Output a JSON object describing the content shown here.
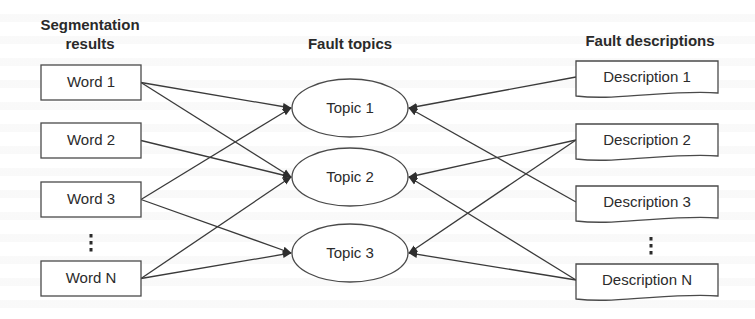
{
  "columns": {
    "left": {
      "title_line1": "Segmentation",
      "title_line2": "results"
    },
    "middle": {
      "title": "Fault topics"
    },
    "right": {
      "title": "Fault descriptions"
    }
  },
  "words": [
    {
      "id": "w1",
      "label": "Word 1",
      "y": 65
    },
    {
      "id": "w2",
      "label": "Word 2",
      "y": 123
    },
    {
      "id": "w3",
      "label": "Word 3",
      "y": 182
    },
    {
      "id": "wN",
      "label": "Word N",
      "y": 261
    }
  ],
  "word_ellipsis": "⋮",
  "topics": [
    {
      "id": "t1",
      "label": "Topic 1",
      "cy": 108
    },
    {
      "id": "t2",
      "label": "Topic 2",
      "cy": 177
    },
    {
      "id": "t3",
      "label": "Topic 3",
      "cy": 253
    }
  ],
  "descriptions": [
    {
      "id": "d1",
      "label": "Description 1",
      "y": 61
    },
    {
      "id": "d2",
      "label": "Description 2",
      "y": 124
    },
    {
      "id": "d3",
      "label": "Description 3",
      "y": 186
    },
    {
      "id": "dN",
      "label": "Description N",
      "y": 264
    }
  ],
  "description_ellipsis": "⋮",
  "edges_word_to_topic": [
    [
      "w1",
      "t1"
    ],
    [
      "w1",
      "t2"
    ],
    [
      "w2",
      "t2"
    ],
    [
      "w3",
      "t1"
    ],
    [
      "w3",
      "t3"
    ],
    [
      "wN",
      "t2"
    ],
    [
      "wN",
      "t3"
    ]
  ],
  "edges_description_to_topic": [
    [
      "d1",
      "t1"
    ],
    [
      "d2",
      "t2"
    ],
    [
      "d2",
      "t3"
    ],
    [
      "d3",
      "t1"
    ],
    [
      "dN",
      "t2"
    ],
    [
      "dN",
      "t3"
    ]
  ],
  "colors": {
    "stroke": "#3a3a3a",
    "text": "#2b2b2b",
    "background": "#ffffff"
  }
}
